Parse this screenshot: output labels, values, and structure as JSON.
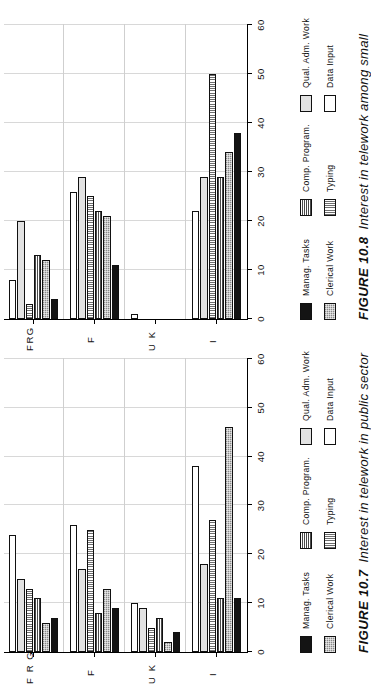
{
  "page": {
    "background": "#ffffff",
    "orientation": "rotated-90-ccw"
  },
  "figures": [
    {
      "id": "figure-10-7",
      "caption_number": "FIGURE 10.7",
      "caption_text": "Interest in telework in public sector",
      "chart_data": {
        "type": "bar",
        "orientation": "horizontal",
        "title": "Interest in telework in public sector",
        "xlabel": "",
        "ylabel": "",
        "xlim": [
          0,
          60
        ],
        "xticks": [
          0,
          10,
          20,
          30,
          40,
          50,
          60
        ],
        "ticklabels": [
          "0",
          "10",
          "20",
          "30",
          "40",
          "50",
          "60"
        ],
        "grid": true,
        "legend_position": "below-plot",
        "categories": [
          "I",
          "U K",
          "F",
          "F R G"
        ],
        "series": [
          {
            "name": "Manag. Tasks",
            "key": "manag",
            "values": [
              11,
              4,
              9,
              7
            ]
          },
          {
            "name": "Clerical Work",
            "key": "cler",
            "values": [
              46,
              2,
              13,
              6
            ]
          },
          {
            "name": "Comp. Program.",
            "key": "comp",
            "values": [
              11,
              7,
              8,
              11
            ]
          },
          {
            "name": "Typing",
            "key": "typ",
            "values": [
              27,
              5,
              25,
              13
            ]
          },
          {
            "name": "Qual. Adm. Work",
            "key": "qual",
            "values": [
              18,
              9,
              17,
              15
            ]
          },
          {
            "name": "Data Input",
            "key": "data",
            "values": [
              38,
              10,
              26,
              24
            ]
          }
        ]
      }
    },
    {
      "id": "figure-10-8",
      "caption_number": "FIGURE 10.8",
      "caption_text": "Interest in telework among small",
      "chart_data": {
        "type": "bar",
        "orientation": "horizontal",
        "title": "Interest in telework among small",
        "xlabel": "",
        "ylabel": "",
        "xlim": [
          0,
          60
        ],
        "xticks": [
          0,
          10,
          20,
          30,
          40,
          50,
          60
        ],
        "ticklabels": [
          "0",
          "10",
          "20",
          "30",
          "40",
          "50",
          "60"
        ],
        "grid": true,
        "legend_position": "below-plot",
        "categories": [
          "I",
          "U K",
          "F",
          "FRG"
        ],
        "series": [
          {
            "name": "Manag. Tasks",
            "key": "manag",
            "values": [
              38,
              0,
              11,
              4
            ]
          },
          {
            "name": "Clerical Work",
            "key": "cler",
            "values": [
              34,
              0,
              21,
              12
            ]
          },
          {
            "name": "Comp. Program.",
            "key": "comp",
            "values": [
              29,
              0,
              22,
              13
            ]
          },
          {
            "name": "Typing",
            "key": "typ",
            "values": [
              50,
              0,
              25,
              3
            ]
          },
          {
            "name": "Qual. Adm. Work",
            "key": "qual",
            "values": [
              29,
              0,
              29,
              20
            ]
          },
          {
            "name": "Data Input",
            "key": "data",
            "values": [
              22,
              1,
              26,
              8
            ]
          }
        ]
      }
    }
  ],
  "legend_items": [
    {
      "label": "Manag. Tasks",
      "key": "manag",
      "swatch": "solid-black"
    },
    {
      "label": "Clerical Work",
      "key": "cler",
      "swatch": "mid-gray-stipple"
    },
    {
      "label": "Comp. Program.",
      "key": "comp",
      "swatch": "checkerboard"
    },
    {
      "label": "Typing",
      "key": "typ",
      "swatch": "vertical-lines"
    },
    {
      "label": "Qual. Adm. Work",
      "key": "qual",
      "swatch": "light-gray"
    },
    {
      "label": "Data Input",
      "key": "data",
      "swatch": "white"
    }
  ],
  "colors": {
    "axis": "#000000",
    "grid": "#d8d8d8",
    "text": "#111111",
    "manag": "#141414",
    "cler": "#8a8a8a",
    "comp": "#6a6a6a",
    "typ": "#6d6d6d",
    "qual": "#e2e2e2",
    "data": "#ffffff"
  }
}
